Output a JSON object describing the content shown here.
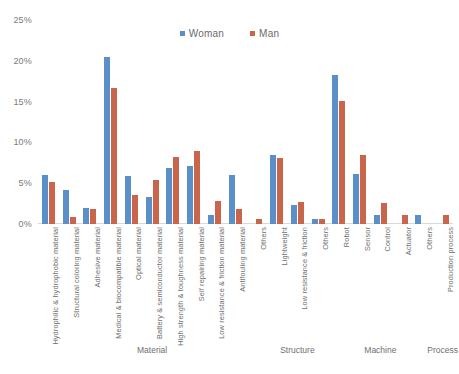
{
  "chart_data": {
    "type": "bar",
    "title": "",
    "xlabel": "",
    "ylabel": "",
    "ylim": [
      0,
      25
    ],
    "ytick_labels": [
      "0%",
      "5%",
      "10%",
      "15%",
      "20%",
      "25%"
    ],
    "ytick_values": [
      0,
      5,
      10,
      15,
      20,
      25
    ],
    "grid": false,
    "legend_position": "top-center",
    "value_unit": "%",
    "categories": [
      "Hydrophilic & hydrophobic material",
      "Structural coloring material",
      "Adhesive material",
      "Medical & biocompatible material",
      "Optical material",
      "Battery & semiconductor material",
      "High strength & toughness material",
      "Self repairing material",
      "Low resistance & friction material",
      "Antifouling material",
      "Others",
      "Lightweight",
      "Low resistance & friction",
      "Others",
      "Robot",
      "Sensor",
      "Control",
      "Actuator",
      "Others",
      "Production process"
    ],
    "series": [
      {
        "name": "Woman",
        "color": "#5b8fc7",
        "values": [
          6.0,
          4.2,
          2.0,
          20.5,
          5.9,
          3.3,
          6.9,
          7.1,
          1.1,
          6.0,
          0.0,
          8.5,
          2.3,
          0.6,
          18.3,
          6.1,
          1.1,
          0.0,
          1.1,
          0.0
        ]
      },
      {
        "name": "Man",
        "color": "#c8654a",
        "values": [
          5.1,
          0.9,
          1.8,
          16.7,
          3.6,
          5.4,
          8.2,
          9.0,
          2.8,
          1.8,
          0.6,
          8.1,
          2.7,
          0.6,
          15.1,
          8.4,
          2.6,
          1.1,
          0.0,
          1.1
        ]
      }
    ],
    "groups": [
      {
        "label": "Material",
        "start_index": 0,
        "end_index": 10
      },
      {
        "label": "Structure",
        "start_index": 11,
        "end_index": 13
      },
      {
        "label": "Machine",
        "start_index": 14,
        "end_index": 18
      },
      {
        "label": "Process",
        "start_index": 19,
        "end_index": 19
      }
    ]
  }
}
